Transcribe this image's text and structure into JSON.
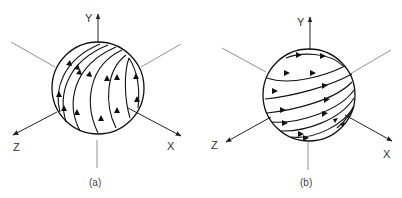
{
  "figures": [
    {
      "id": "a",
      "caption": "(a)",
      "axes": {
        "y": "Y",
        "z": "Z",
        "x": "X"
      },
      "flow_direction": "upward (meridional field lines toward Y pole)"
    },
    {
      "id": "b",
      "caption": "(b)",
      "axes": {
        "y": "Y",
        "z": "Z",
        "x": "X"
      },
      "flow_direction": "rightward (latitudinal field lines toward X side)"
    }
  ],
  "colors": {
    "stroke": "#1a1a1a",
    "axis": "#555555",
    "background": "#ffffff"
  }
}
